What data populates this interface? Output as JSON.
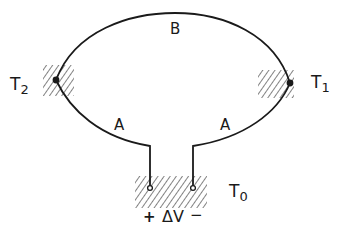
{
  "diagram": {
    "wires": {
      "b_label": "B",
      "a_left_label": "A",
      "a_right_label": "A"
    },
    "junctions": {
      "t1": {
        "label": "T",
        "subscript": "1"
      },
      "t2": {
        "label": "T",
        "subscript": "2"
      },
      "t0": {
        "label": "T",
        "subscript": "0"
      }
    },
    "voltage": {
      "plus": "+",
      "label": "ΔV",
      "minus": "−"
    },
    "colors": {
      "line": "#1a1a1a",
      "background": "#ffffff"
    }
  }
}
